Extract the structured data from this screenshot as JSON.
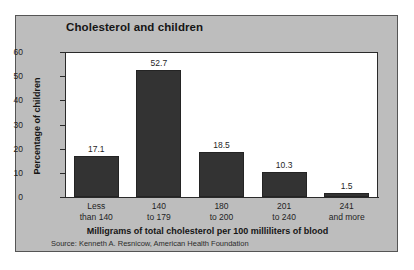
{
  "figure": {
    "background_color": "#ffffff",
    "panel_color": "#bdbdbd",
    "plot_background_color": "#ffffff",
    "bar_color": "#333333",
    "axis_color": "#2a2a2a",
    "title": "Cholesterol and children",
    "source_note": "Source: Kenneth A. Resnicow, American Health Foundation"
  },
  "chart_data": {
    "type": "bar",
    "title": "Cholesterol and children",
    "xlabel": "Milligrams of total cholesterol per 100 milliliters of blood",
    "ylabel": "Percentage of children",
    "categories": [
      "Less than 140",
      "140 to 179",
      "180 to 200",
      "201 to 240",
      "241 and more"
    ],
    "category_lines": [
      [
        "Less",
        "than 140"
      ],
      [
        "140",
        "to 179"
      ],
      [
        "180",
        "to 200"
      ],
      [
        "201",
        "to 240"
      ],
      [
        "241",
        "and more"
      ]
    ],
    "values": [
      17.1,
      52.7,
      18.5,
      10.3,
      1.5
    ],
    "value_labels": [
      "17.1",
      "52.7",
      "18.5",
      "10.3",
      "1.5"
    ],
    "ylim": [
      0,
      60
    ],
    "yticks": [
      0,
      10,
      20,
      30,
      40,
      50,
      60
    ],
    "ytick_labels": [
      "0",
      "10",
      "20",
      "30",
      "40",
      "50",
      "60"
    ],
    "grid": false,
    "legend": false,
    "bar_color": "#333333",
    "source": "Source: Kenneth A. Resnicow, American Health Foundation"
  }
}
